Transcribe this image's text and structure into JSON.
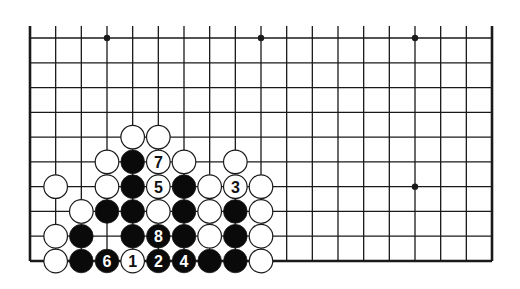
{
  "diagram": {
    "type": "go-board-fragment",
    "columns": 19,
    "visible_rows": 10,
    "edges": {
      "left": true,
      "right": true,
      "bottom": true,
      "top": false
    },
    "colors": {
      "line": "#1a1a1a",
      "black_stone": "#0a0a0a",
      "white_stone": "#ffffff",
      "background": "#ffffff"
    },
    "star_points": [
      {
        "col": 3,
        "row": 0
      },
      {
        "col": 9,
        "row": 0
      },
      {
        "col": 15,
        "row": 0
      },
      {
        "col": 15,
        "row": 6
      }
    ],
    "stones": [
      {
        "col": 4,
        "row": 4,
        "color": "white",
        "label": ""
      },
      {
        "col": 5,
        "row": 4,
        "color": "white",
        "label": ""
      },
      {
        "col": 3,
        "row": 5,
        "color": "white",
        "label": ""
      },
      {
        "col": 4,
        "row": 5,
        "color": "black",
        "label": ""
      },
      {
        "col": 5,
        "row": 5,
        "color": "white",
        "label": "7"
      },
      {
        "col": 6,
        "row": 5,
        "color": "white",
        "label": ""
      },
      {
        "col": 8,
        "row": 5,
        "color": "white",
        "label": ""
      },
      {
        "col": 1,
        "row": 6,
        "color": "white",
        "label": ""
      },
      {
        "col": 3,
        "row": 6,
        "color": "white",
        "label": ""
      },
      {
        "col": 4,
        "row": 6,
        "color": "black",
        "label": ""
      },
      {
        "col": 5,
        "row": 6,
        "color": "white",
        "label": "5"
      },
      {
        "col": 6,
        "row": 6,
        "color": "black",
        "label": ""
      },
      {
        "col": 7,
        "row": 6,
        "color": "white",
        "label": ""
      },
      {
        "col": 8,
        "row": 6,
        "color": "white",
        "label": "3"
      },
      {
        "col": 9,
        "row": 6,
        "color": "white",
        "label": ""
      },
      {
        "col": 2,
        "row": 7,
        "color": "white",
        "label": ""
      },
      {
        "col": 3,
        "row": 7,
        "color": "black",
        "label": ""
      },
      {
        "col": 4,
        "row": 7,
        "color": "black",
        "label": ""
      },
      {
        "col": 5,
        "row": 7,
        "color": "white",
        "label": ""
      },
      {
        "col": 6,
        "row": 7,
        "color": "black",
        "label": ""
      },
      {
        "col": 7,
        "row": 7,
        "color": "white",
        "label": ""
      },
      {
        "col": 8,
        "row": 7,
        "color": "black",
        "label": ""
      },
      {
        "col": 9,
        "row": 7,
        "color": "white",
        "label": ""
      },
      {
        "col": 1,
        "row": 8,
        "color": "white",
        "label": ""
      },
      {
        "col": 2,
        "row": 8,
        "color": "black",
        "label": ""
      },
      {
        "col": 4,
        "row": 8,
        "color": "black",
        "label": ""
      },
      {
        "col": 5,
        "row": 8,
        "color": "black",
        "label": "8"
      },
      {
        "col": 6,
        "row": 8,
        "color": "black",
        "label": ""
      },
      {
        "col": 7,
        "row": 8,
        "color": "white",
        "label": ""
      },
      {
        "col": 8,
        "row": 8,
        "color": "black",
        "label": ""
      },
      {
        "col": 9,
        "row": 8,
        "color": "white",
        "label": ""
      },
      {
        "col": 1,
        "row": 9,
        "color": "white",
        "label": ""
      },
      {
        "col": 2,
        "row": 9,
        "color": "black",
        "label": ""
      },
      {
        "col": 3,
        "row": 9,
        "color": "black",
        "label": "6"
      },
      {
        "col": 4,
        "row": 9,
        "color": "white",
        "label": "1"
      },
      {
        "col": 5,
        "row": 9,
        "color": "black",
        "label": "2"
      },
      {
        "col": 6,
        "row": 9,
        "color": "black",
        "label": "4"
      },
      {
        "col": 7,
        "row": 9,
        "color": "black",
        "label": ""
      },
      {
        "col": 8,
        "row": 9,
        "color": "black",
        "label": ""
      },
      {
        "col": 9,
        "row": 9,
        "color": "white",
        "label": ""
      }
    ]
  }
}
